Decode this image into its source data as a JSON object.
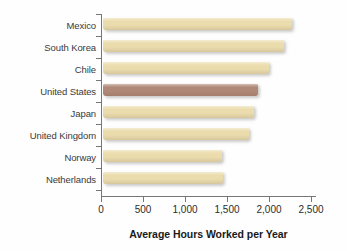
{
  "chart_data": {
    "type": "bar",
    "orientation": "horizontal",
    "title": "",
    "xlabel": "Average Hours Worked per Year",
    "ylabel": "",
    "xlim": [
      0,
      2500
    ],
    "xticks": [
      0,
      500,
      1000,
      1500,
      2000,
      2500
    ],
    "xtick_labels": [
      "0",
      "500",
      "1,000",
      "1,500",
      "2,000",
      "2,500"
    ],
    "grid": false,
    "legend": null,
    "categories": [
      "Mexico",
      "South Korea",
      "Chile",
      "United States",
      "Japan",
      "United Kingdom",
      "Norway",
      "Netherlands"
    ],
    "values": [
      2250,
      2150,
      1975,
      1840,
      1800,
      1735,
      1420,
      1425
    ],
    "bar_colors": [
      "#ebdcae",
      "#ebdcae",
      "#ebdcae",
      "#b08878",
      "#ebdcae",
      "#ebdcae",
      "#ebdcae",
      "#ebdcae"
    ],
    "highlighted_category": "United States",
    "colors": {
      "bar_default": "#ebdcae",
      "bar_highlight": "#b08878",
      "axis": "#77777a",
      "category_label": "#3a3a3a",
      "tick_label": "#2c2c2c",
      "axis_title": "#1a1a1a",
      "background": "#fefefe"
    }
  }
}
